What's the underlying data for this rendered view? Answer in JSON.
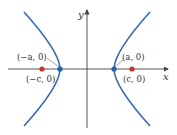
{
  "diagram": {
    "type": "hyperbola",
    "axes": {
      "x_label": "x",
      "y_label": "y"
    },
    "points": [
      {
        "name": "left-focus",
        "label": "(−c, 0)",
        "color": "#d0312d"
      },
      {
        "name": "left-vertex",
        "label": "(−a, 0)",
        "color": "#1f5fb5"
      },
      {
        "name": "right-vertex",
        "label": "(a, 0)",
        "color": "#1f5fb5"
      },
      {
        "name": "right-focus",
        "label": "(c, 0)",
        "color": "#d0312d"
      }
    ],
    "curve_color": "#2f6bc6"
  }
}
